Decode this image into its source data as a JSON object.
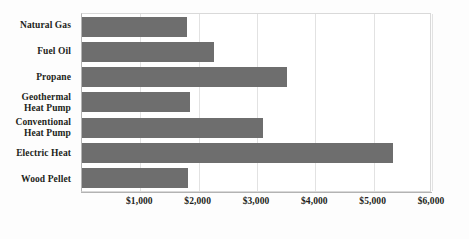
{
  "chart_data": {
    "type": "bar",
    "orientation": "horizontal",
    "title": "",
    "subtitle": "",
    "xlabel": "",
    "ylabel": "",
    "categories": [
      "Natural Gas",
      "Fuel Oil",
      "Propane",
      "Geothermal Heat Pump",
      "Conventional Heat Pump",
      "Electric Heat",
      "Wood Pellet"
    ],
    "category_label_lines": [
      [
        "Natural Gas"
      ],
      [
        "Fuel Oil"
      ],
      [
        "Propane"
      ],
      [
        "Geothermal",
        "Heat Pump"
      ],
      [
        "Conventional",
        "Heat Pump"
      ],
      [
        "Electric Heat"
      ],
      [
        "Wood Pellet"
      ]
    ],
    "values": [
      1800,
      2265,
      3515,
      1850,
      3105,
      5335,
      1820
    ],
    "xlim": [
      0,
      6000
    ],
    "xticks": [
      1000,
      2000,
      3000,
      4000,
      5000,
      6000
    ],
    "xtick_labels": [
      "$1,000",
      "$2,000",
      "$3,000",
      "$4,000",
      "$5,000",
      "$6,000"
    ],
    "grid": "vertical",
    "legend": "none",
    "bar_color": "#6e6e6e",
    "gridline_color": "#e2e2e2",
    "axis_color": "#b3b3b3",
    "text_color": "#231f20",
    "background_color": "#ffffff"
  }
}
